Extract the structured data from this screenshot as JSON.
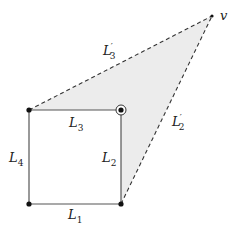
{
  "diagram": {
    "shading_color": "#ececec",
    "line_color": "#444444",
    "dash_color": "#333333",
    "points": {
      "v": {
        "label": "v",
        "x": 212,
        "y": 16
      },
      "top_left": {
        "x": 29,
        "y": 110
      },
      "top_right": {
        "x": 121,
        "y": 110
      },
      "bottom_left": {
        "x": 29,
        "y": 204
      },
      "bottom_right": {
        "x": 121,
        "y": 204
      }
    },
    "edges": {
      "L1": {
        "base": "L",
        "sub": "1",
        "prime": ""
      },
      "L2": {
        "base": "L",
        "sub": "2",
        "prime": ""
      },
      "L3": {
        "base": "L",
        "sub": "3",
        "prime": ""
      },
      "L4": {
        "base": "L",
        "sub": "4",
        "prime": ""
      },
      "L2p": {
        "base": "L",
        "sub": "2",
        "prime": "′"
      },
      "L3p": {
        "base": "L",
        "sub": "3",
        "prime": "′"
      }
    },
    "vertex_label": "v",
    "highlighted_vertex": "top_right"
  }
}
